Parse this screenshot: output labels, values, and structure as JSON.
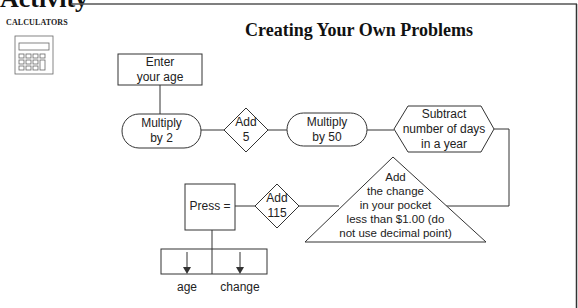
{
  "header": {
    "activity_title": "Activity",
    "section_label": "CALCULATORS",
    "title": "Creating Your Own Problems"
  },
  "icons": {
    "calculator": "calculator-icon"
  },
  "flowchart": {
    "steps": [
      {
        "shape": "rectangle",
        "lines": [
          "Enter",
          "your age"
        ]
      },
      {
        "shape": "rounded",
        "lines": [
          "Multiply",
          "by 2"
        ]
      },
      {
        "shape": "diamond",
        "lines": [
          "Add",
          "5"
        ]
      },
      {
        "shape": "rounded",
        "lines": [
          "Multiply",
          "by 50"
        ]
      },
      {
        "shape": "hexagon",
        "lines": [
          "Subtract",
          "number of days",
          "in a year"
        ]
      },
      {
        "shape": "triangle",
        "lines": [
          "Add",
          "the change",
          "in your pocket",
          "less than $1.00 (do",
          "not use decimal point)"
        ]
      },
      {
        "shape": "diamond",
        "lines": [
          "Add",
          "115"
        ]
      },
      {
        "shape": "rectangle",
        "lines": [
          "Press ="
        ]
      }
    ],
    "outputs": [
      "age",
      "change"
    ]
  }
}
